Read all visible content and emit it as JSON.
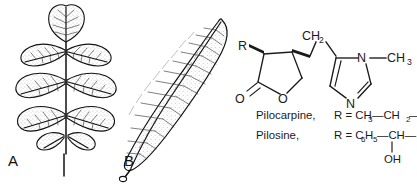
{
  "figure": {
    "background_color": "#ffffff",
    "ink_color": "#1a1a1a",
    "panels": [
      {
        "id": "A",
        "label": "A",
        "name": "compound-leaf-illustration",
        "description": "pinnately compound leaf with terminal leaflet and three pairs of lateral leaflets"
      },
      {
        "id": "B",
        "label": "B",
        "name": "simple-leaf-illustration",
        "description": "single elongated lanceolate leaf tilted diagonally"
      }
    ]
  },
  "structure": {
    "name": "pilocarpine-skeleton",
    "atoms": {
      "r_group": "R",
      "carbonyl_oxygen": "O",
      "ring_oxygen": "O",
      "methylene_bridge": "CH",
      "methylene_bridge_sub": "2",
      "ring_nitrogen_substituted": "N",
      "ring_nitrogen_imine": "N",
      "n_methyl": "CH",
      "n_methyl_sub": "3"
    }
  },
  "legend": {
    "rows": [
      {
        "compound": "Pilocarpine,",
        "r_prefix": "R = CH",
        "r_prefix_sub": "3",
        "r_mid": "—CH",
        "r_mid_sub": "2",
        "r_suffix": "—",
        "hydroxyl": ""
      },
      {
        "compound": "Pilosine,",
        "r_prefix": "R = C",
        "r_prefix_sub": "6",
        "r_prefix2": "H",
        "r_prefix2_sub": "5",
        "r_mid": "—CH—",
        "r_mid_sub": "",
        "r_suffix": "",
        "hydroxyl": "OH"
      }
    ]
  }
}
